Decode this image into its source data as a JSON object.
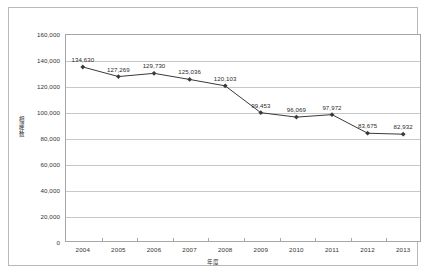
{
  "chart_data": {
    "type": "line",
    "title": "",
    "xlabel": "年度",
    "ylabel": "相談件数",
    "categories": [
      "2004",
      "2005",
      "2006",
      "2007",
      "2008",
      "2009",
      "2010",
      "2011",
      "2012",
      "2013"
    ],
    "values": [
      134630,
      127269,
      129730,
      125036,
      120103,
      99453,
      96069,
      97972,
      83675,
      82932
    ],
    "point_labels": [
      "134,630",
      "127,269",
      "129,730",
      "125,036",
      "120,103",
      "99,453",
      "96,069",
      "97,972",
      "83,675",
      "82,932"
    ],
    "ylim": [
      0,
      160000
    ],
    "ytick_values": [
      0,
      20000,
      40000,
      60000,
      80000,
      100000,
      120000,
      140000,
      160000
    ],
    "ytick_labels": [
      "0",
      "20,000",
      "40,000",
      "60,000",
      "80,000",
      "100,000",
      "120,000",
      "140,000",
      "160,000"
    ],
    "grid": "horizontal",
    "legend": "none",
    "series_color": "#3a3a3a",
    "gridline_color": "#c8c8c8",
    "axis_color": "#a6a6a6",
    "marker": "diamond"
  }
}
